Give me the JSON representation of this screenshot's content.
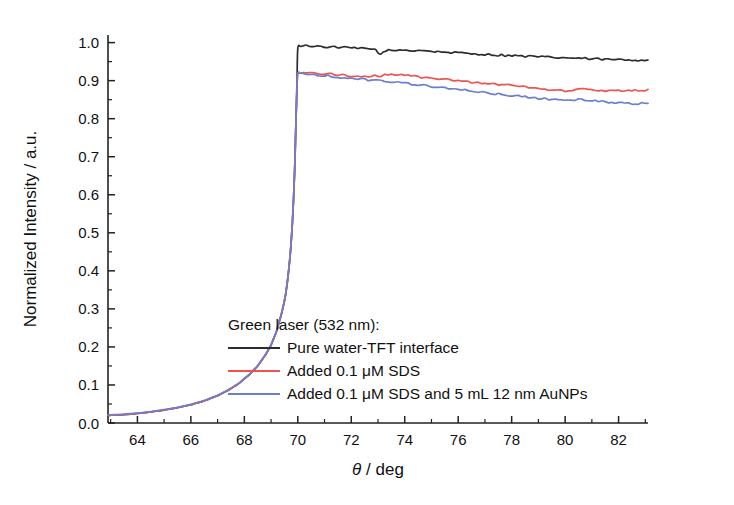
{
  "chart_data": {
    "type": "line",
    "title": "",
    "xlabel": "θ / deg",
    "ylabel": "Normalized Intensity / a.u.",
    "xlim": [
      62.9,
      83.1
    ],
    "ylim": [
      0.0,
      1.02
    ],
    "xticks": [
      64,
      66,
      68,
      70,
      72,
      74,
      76,
      78,
      80,
      82
    ],
    "xtick_labels": [
      "64",
      "66",
      "68",
      "70",
      "72",
      "74",
      "76",
      "78",
      "80",
      "82"
    ],
    "x_minor_tick_step": 1,
    "yticks": [
      0.0,
      0.1,
      0.2,
      0.3,
      0.4,
      0.5,
      0.6,
      0.7,
      0.8,
      0.9,
      1.0
    ],
    "ytick_labels": [
      "0.0",
      "0.1",
      "0.2",
      "0.3",
      "0.4",
      "0.5",
      "0.6",
      "0.7",
      "0.8",
      "0.9",
      "1.0"
    ],
    "y_minor_tick_step": 0.05,
    "grid": false,
    "legend_position": "center-right-inside",
    "legend_title": "Green laser (532 nm):",
    "critical_angle_deg": 69.95,
    "series": [
      {
        "name": "Pure water-TFT interface",
        "color": "#2b2b33",
        "x": [
          62.9,
          63.5,
          64.0,
          64.5,
          65.0,
          65.5,
          66.0,
          66.5,
          67.0,
          67.4,
          67.8,
          68.2,
          68.5,
          68.8,
          69.0,
          69.2,
          69.4,
          69.55,
          69.7,
          69.8,
          69.88,
          69.93,
          69.97,
          70.0,
          70.1,
          70.3,
          70.6,
          71.0,
          71.5,
          72.0,
          72.5,
          72.9,
          73.1,
          73.3,
          73.5,
          73.8,
          74.2,
          74.6,
          75.0,
          75.5,
          76.0,
          76.5,
          77.0,
          77.5,
          78.0,
          78.5,
          79.0,
          79.5,
          80.0,
          80.5,
          81.0,
          81.5,
          82.0,
          82.5,
          83.1
        ],
        "y": [
          0.02,
          0.022,
          0.025,
          0.029,
          0.034,
          0.04,
          0.048,
          0.058,
          0.072,
          0.086,
          0.104,
          0.128,
          0.15,
          0.18,
          0.205,
          0.24,
          0.29,
          0.34,
          0.43,
          0.53,
          0.66,
          0.79,
          0.9,
          0.985,
          0.99,
          0.992,
          0.991,
          0.989,
          0.988,
          0.986,
          0.984,
          0.982,
          0.968,
          0.98,
          0.978,
          0.981,
          0.979,
          0.98,
          0.977,
          0.975,
          0.973,
          0.971,
          0.969,
          0.967,
          0.966,
          0.964,
          0.963,
          0.961,
          0.96,
          0.959,
          0.957,
          0.956,
          0.955,
          0.954,
          0.955
        ]
      },
      {
        "name": "Added 0.1 μM SDS",
        "color": "#ef5350",
        "x": [
          62.9,
          63.5,
          64.0,
          64.5,
          65.0,
          65.5,
          66.0,
          66.5,
          67.0,
          67.4,
          67.8,
          68.2,
          68.5,
          68.8,
          69.0,
          69.2,
          69.4,
          69.55,
          69.7,
          69.8,
          69.88,
          69.93,
          69.97,
          70.0,
          70.2,
          70.5,
          71.0,
          71.5,
          72.0,
          72.5,
          73.0,
          73.5,
          74.0,
          74.5,
          75.0,
          75.5,
          76.0,
          76.5,
          77.0,
          77.5,
          78.0,
          78.5,
          79.0,
          79.5,
          80.0,
          80.5,
          81.0,
          81.5,
          82.0,
          82.5,
          83.1
        ],
        "y": [
          0.02,
          0.022,
          0.025,
          0.029,
          0.034,
          0.04,
          0.048,
          0.058,
          0.072,
          0.086,
          0.104,
          0.128,
          0.15,
          0.18,
          0.205,
          0.24,
          0.29,
          0.34,
          0.43,
          0.53,
          0.66,
          0.79,
          0.88,
          0.918,
          0.921,
          0.92,
          0.918,
          0.916,
          0.913,
          0.911,
          0.913,
          0.915,
          0.914,
          0.91,
          0.906,
          0.903,
          0.899,
          0.896,
          0.893,
          0.89,
          0.888,
          0.884,
          0.88,
          0.876,
          0.873,
          0.877,
          0.876,
          0.874,
          0.873,
          0.874,
          0.876
        ]
      },
      {
        "name": "Added 0.1 μM SDS and 5 mL 12 nm AuNPs",
        "color": "#6b7fd0",
        "x": [
          62.9,
          63.5,
          64.0,
          64.5,
          65.0,
          65.5,
          66.0,
          66.5,
          67.0,
          67.4,
          67.8,
          68.2,
          68.5,
          68.8,
          69.0,
          69.2,
          69.4,
          69.55,
          69.7,
          69.8,
          69.88,
          69.93,
          69.97,
          70.0,
          70.2,
          70.5,
          71.0,
          71.5,
          72.0,
          72.5,
          73.0,
          73.5,
          74.0,
          74.5,
          75.0,
          75.5,
          76.0,
          76.5,
          77.0,
          77.5,
          78.0,
          78.5,
          79.0,
          79.5,
          80.0,
          80.5,
          81.0,
          81.5,
          82.0,
          82.5,
          83.1
        ],
        "y": [
          0.021,
          0.023,
          0.026,
          0.03,
          0.035,
          0.041,
          0.049,
          0.059,
          0.073,
          0.087,
          0.105,
          0.129,
          0.151,
          0.181,
          0.206,
          0.241,
          0.291,
          0.341,
          0.431,
          0.531,
          0.661,
          0.791,
          0.882,
          0.92,
          0.919,
          0.917,
          0.913,
          0.91,
          0.906,
          0.903,
          0.9,
          0.897,
          0.893,
          0.889,
          0.885,
          0.881,
          0.877,
          0.873,
          0.869,
          0.865,
          0.861,
          0.857,
          0.853,
          0.852,
          0.849,
          0.85,
          0.847,
          0.844,
          0.842,
          0.84,
          0.841
        ]
      }
    ]
  }
}
